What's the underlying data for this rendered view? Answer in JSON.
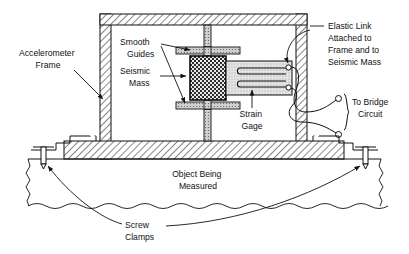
{
  "figure": {
    "labels": {
      "accelerometer_frame": {
        "lines": [
          "Accelerometer",
          "Frame"
        ],
        "x": 48,
        "y": 56,
        "anchor": "middle"
      },
      "smooth_guides": {
        "lines": [
          "Smooth",
          "Guides"
        ],
        "x": 120,
        "y": 45,
        "anchor": "start"
      },
      "seismic_mass": {
        "lines": [
          "Seismic",
          "Mass"
        ],
        "x": 120,
        "y": 74,
        "anchor": "start"
      },
      "elastic_link": {
        "lines": [
          "Elastic Link",
          "Attached to",
          "Frame and to",
          "Seismic Mass"
        ],
        "x": 328,
        "y": 29,
        "anchor": "start"
      },
      "strain_gage": {
        "lines": [
          "Strain",
          "Gage"
        ],
        "x": 252,
        "y": 117,
        "anchor": "middle"
      },
      "to_bridge_circuit": {
        "lines": [
          "To Bridge",
          "Circuit"
        ],
        "x": 352,
        "y": 97,
        "anchor": "start"
      },
      "object_being_measured": {
        "lines": [
          "Object Being",
          "Measured"
        ],
        "x": 198,
        "y": 177,
        "anchor": "middle"
      },
      "screw_clamps": {
        "lines": [
          "Screw",
          "Clamps"
        ],
        "x": 125,
        "y": 228,
        "anchor": "start"
      }
    },
    "colors": {
      "line": "#111111",
      "frame_hatch": "#333333",
      "frame_fill": "#ffffff",
      "seismic_mass_fill": "#3a3a3a",
      "elastic_link_fill": "#d8d8d8",
      "guide_fill": "#cccccc",
      "background": "#ffffff",
      "text": "#111111"
    },
    "geometry": {
      "frame_outer": {
        "x": 100,
        "y": 14,
        "w": 232,
        "h": 145
      },
      "frame_wall": 11,
      "seismic_mass": {
        "x": 190,
        "y": 56,
        "w": 36,
        "h": 44
      },
      "elastic_link": {
        "x": 226,
        "y": 61,
        "w": 66,
        "h": 34
      },
      "object_top_y": 159,
      "object_break_y": 205
    },
    "icons": {
      "arrow": "arrowhead",
      "terminal": "circle-terminal",
      "break": "wavy-break-line"
    }
  }
}
